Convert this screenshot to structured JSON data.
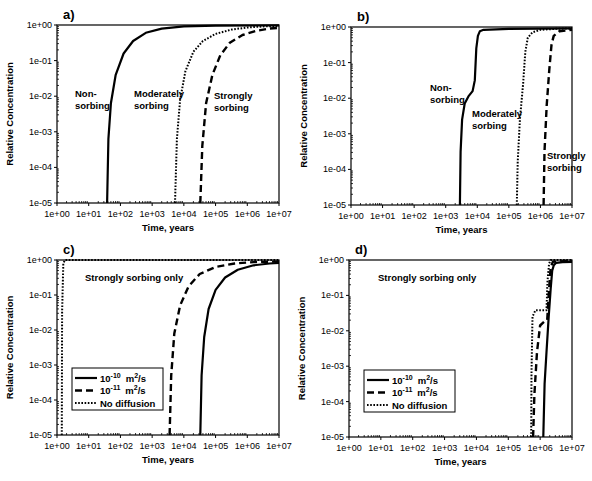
{
  "chart_data": [
    {
      "id": "a",
      "type": "line",
      "panel_label": "a)",
      "xlabel": "Time, years",
      "ylabel": "Relative Concentration",
      "xscale": "log",
      "yscale": "log",
      "xlim": [
        1,
        10000000
      ],
      "ylim": [
        1e-05,
        1
      ],
      "x_ticks": [
        "1e+00",
        "1e+01",
        "1e+02",
        "1e+03",
        "1e+04",
        "1e+05",
        "1e+06",
        "1e+07"
      ],
      "y_ticks": [
        "1e+00",
        "1e-01",
        "1e-02",
        "1e-03",
        "1e-04",
        "1e-05"
      ],
      "annotations": [
        {
          "text": "Non-",
          "x": 75,
          "y": 97
        },
        {
          "text": "sorbing",
          "x": 75,
          "y": 109
        },
        {
          "text": "Moderately",
          "x": 134,
          "y": 97
        },
        {
          "text": "sorbing",
          "x": 134,
          "y": 109
        },
        {
          "text": "Strongly",
          "x": 214,
          "y": 99
        },
        {
          "text": "sorbing",
          "x": 214,
          "y": 111
        }
      ],
      "series": [
        {
          "name": "Non-sorbing",
          "style": "solid",
          "log_x": [
            1.58,
            1.62,
            1.7,
            1.85,
            2.1,
            2.4,
            2.8,
            3.3,
            4.0,
            5.0,
            7.0
          ],
          "log_y": [
            -5,
            -3.2,
            -2.2,
            -1.4,
            -0.8,
            -0.45,
            -0.22,
            -0.1,
            -0.04,
            -0.02,
            -0.01
          ]
        },
        {
          "name": "Moderately sorbing",
          "style": "dotted",
          "log_x": [
            3.72,
            3.78,
            3.88,
            4.05,
            4.3,
            4.6,
            5.0,
            5.5,
            6.0,
            6.5,
            7.0
          ],
          "log_y": [
            -5,
            -3.2,
            -2.1,
            -1.3,
            -0.75,
            -0.45,
            -0.25,
            -0.13,
            -0.07,
            -0.04,
            -0.03
          ]
        },
        {
          "name": "Strongly sorbing",
          "style": "dashed",
          "log_x": [
            4.52,
            4.58,
            4.7,
            4.9,
            5.15,
            5.45,
            5.85,
            6.3,
            6.7,
            7.0
          ],
          "log_y": [
            -5,
            -3.4,
            -2.2,
            -1.4,
            -0.85,
            -0.5,
            -0.28,
            -0.16,
            -0.1,
            -0.08
          ]
        }
      ]
    },
    {
      "id": "b",
      "type": "line",
      "panel_label": "b)",
      "xlabel": "Time, years",
      "ylabel": "Relative Concentration",
      "xscale": "log",
      "yscale": "log",
      "xlim": [
        1,
        10000000
      ],
      "ylim": [
        1e-05,
        1
      ],
      "x_ticks": [
        "1e+00",
        "1e+01",
        "1e+02",
        "1e+03",
        "1e+04",
        "1e+05",
        "1e+06",
        "1e+07"
      ],
      "y_ticks": [
        "1e+00",
        "1e-01",
        "1e-02",
        "1e-03",
        "1e-04",
        "1e-05"
      ],
      "annotations": [
        {
          "text": "Non-",
          "x": 430,
          "y": 91
        },
        {
          "text": "sorbing",
          "x": 430,
          "y": 103
        },
        {
          "text": "Moderately",
          "x": 472,
          "y": 117
        },
        {
          "text": "sorbing",
          "x": 472,
          "y": 129
        },
        {
          "text": "Strongly",
          "x": 547,
          "y": 159
        },
        {
          "text": "sorbing",
          "x": 547,
          "y": 171
        }
      ],
      "series": [
        {
          "name": "Non-sorbing",
          "style": "solid",
          "log_x": [
            3.45,
            3.47,
            3.52,
            3.6,
            3.72,
            3.85,
            3.92,
            3.97,
            4.02,
            4.08,
            4.2,
            5.0,
            7.0
          ],
          "log_y": [
            -5,
            -3.5,
            -2.6,
            -2.15,
            -1.95,
            -1.8,
            -1.5,
            -0.6,
            -0.25,
            -0.12,
            -0.08,
            -0.05,
            -0.04
          ]
        },
        {
          "name": "Moderately sorbing",
          "style": "dotted",
          "log_x": [
            5.25,
            5.28,
            5.35,
            5.45,
            5.52,
            5.6,
            5.75,
            6.0,
            6.5,
            7.0
          ],
          "log_y": [
            -5,
            -3.8,
            -2.6,
            -1.6,
            -0.7,
            -0.3,
            -0.15,
            -0.08,
            -0.05,
            -0.04
          ]
        },
        {
          "name": "Strongly sorbing",
          "style": "dashed",
          "log_x": [
            6.1,
            6.13,
            6.2,
            6.28,
            6.35,
            6.42,
            6.6,
            7.0
          ],
          "log_y": [
            -5,
            -3.5,
            -2.2,
            -1.2,
            -0.5,
            -0.25,
            -0.12,
            -0.08
          ]
        }
      ]
    },
    {
      "id": "c",
      "type": "line",
      "panel_label": "c)",
      "xlabel": "Time, years",
      "ylabel": "Relative Concentration",
      "xscale": "log",
      "yscale": "log",
      "xlim": [
        1,
        10000000
      ],
      "ylim": [
        1e-05,
        1
      ],
      "x_ticks": [
        "1e+00",
        "1e+01",
        "1e+02",
        "1e+03",
        "1e+04",
        "1e+05",
        "1e+06",
        "1e+07"
      ],
      "y_ticks": [
        "1e+00",
        "1e-01",
        "1e-02",
        "1e-03",
        "1e-04",
        "1e-05"
      ],
      "annotations": [
        {
          "text": "Strongly sorbing only",
          "x": 85,
          "y": 281
        }
      ],
      "legend": {
        "position": "lower-left",
        "entries": [
          {
            "label_base": "10",
            "label_exp": "-10",
            "label_unit": "m",
            "label_unit_exp": "2",
            "label_tail": "/s",
            "style": "solid"
          },
          {
            "label_base": "10",
            "label_exp": "-11",
            "label_unit": "m",
            "label_unit_exp": "2",
            "label_tail": "/s",
            "style": "dashed"
          },
          {
            "label": "No diffusion",
            "style": "dotted"
          }
        ]
      },
      "series": [
        {
          "name": "1e-10 m2/s",
          "style": "solid",
          "log_x": [
            4.52,
            4.56,
            4.64,
            4.78,
            5.0,
            5.3,
            5.7,
            6.2,
            6.7,
            7.0
          ],
          "log_y": [
            -5,
            -3.3,
            -2.2,
            -1.4,
            -0.85,
            -0.5,
            -0.28,
            -0.15,
            -0.1,
            -0.08
          ]
        },
        {
          "name": "1e-11 m2/s",
          "style": "dashed",
          "log_x": [
            3.55,
            3.6,
            3.7,
            3.88,
            4.15,
            4.5,
            5.0,
            5.6,
            6.2,
            7.0
          ],
          "log_y": [
            -5,
            -3.3,
            -2.1,
            -1.3,
            -0.75,
            -0.4,
            -0.2,
            -0.1,
            -0.06,
            -0.04
          ]
        },
        {
          "name": "No diffusion",
          "style": "dotted",
          "log_x": [
            0.15,
            0.16,
            0.2,
            0.25,
            7.0
          ],
          "log_y": [
            -5,
            -1.5,
            -0.1,
            0,
            0
          ]
        }
      ]
    },
    {
      "id": "d",
      "type": "line",
      "panel_label": "d)",
      "xlabel": "Time, years",
      "ylabel": "Relative Concentration",
      "xscale": "log",
      "yscale": "log",
      "xlim": [
        1,
        10000000
      ],
      "ylim": [
        1e-05,
        1
      ],
      "x_ticks": [
        "1e+00",
        "1e+01",
        "1e+02",
        "1e+03",
        "1e+04",
        "1e+05",
        "1e+06",
        "1e+07"
      ],
      "y_ticks": [
        "1e+00",
        "1e-01",
        "1e-02",
        "1e-03",
        "1e-04",
        "1e-05"
      ],
      "annotations": [
        {
          "text": "Strongly sorbing only",
          "x": 378,
          "y": 281
        }
      ],
      "legend": {
        "position": "lower-left",
        "entries": [
          {
            "label_base": "10",
            "label_exp": "-10",
            "label_unit": "m",
            "label_unit_exp": "2",
            "label_tail": "/s",
            "style": "solid"
          },
          {
            "label_base": "10",
            "label_exp": "-11",
            "label_unit": "m",
            "label_unit_exp": "2",
            "label_tail": "/s",
            "style": "dashed"
          },
          {
            "label": "No diffusion",
            "style": "dotted"
          }
        ]
      },
      "series": [
        {
          "name": "1e-10 m2/s",
          "style": "solid",
          "log_x": [
            6.1,
            6.14,
            6.2,
            6.27,
            6.33,
            6.38,
            6.43,
            6.5,
            6.7,
            7.0
          ],
          "log_y": [
            -5,
            -3.5,
            -2.6,
            -1.6,
            -0.8,
            -0.3,
            -0.15,
            -0.08,
            -0.06,
            -0.05
          ]
        },
        {
          "name": "1e-11 m2/s",
          "style": "dashed",
          "log_x": [
            5.78,
            5.82,
            5.9,
            6.0,
            6.12,
            6.22,
            6.28,
            6.33,
            6.4,
            7.0
          ],
          "log_y": [
            -5,
            -3.8,
            -2.6,
            -1.85,
            -1.75,
            -1.7,
            -0.8,
            -0.2,
            -0.05,
            -0.02
          ]
        },
        {
          "name": "No diffusion",
          "style": "dotted",
          "log_x": [
            5.72,
            5.73,
            5.76,
            5.85,
            6.0,
            6.2,
            6.23,
            6.28,
            6.33,
            7.0
          ],
          "log_y": [
            -5,
            -3.2,
            -1.6,
            -1.42,
            -1.42,
            -1.42,
            -0.6,
            -0.1,
            0,
            0
          ]
        }
      ]
    }
  ],
  "panels": [
    {
      "label": "a)",
      "xlabel": "Time, years",
      "ylabel": "Relative Concentration"
    },
    {
      "label": "b)",
      "xlabel": "Time, years",
      "ylabel": "Relative Concentration"
    },
    {
      "label": "c)",
      "xlabel": "Time, years",
      "ylabel": "Relative Concentration"
    },
    {
      "label": "d)",
      "xlabel": "Time, years",
      "ylabel": "Relative Concentration"
    }
  ]
}
